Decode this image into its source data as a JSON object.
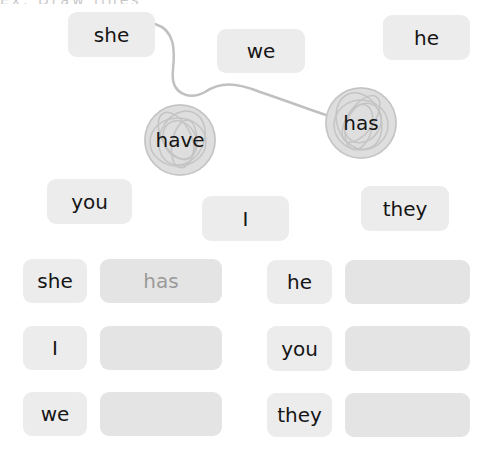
{
  "header": {
    "cutoff_text": "Ex. Draw lines"
  },
  "word_bank": {
    "tiles": [
      {
        "id": "she",
        "label": "she"
      },
      {
        "id": "we",
        "label": "we"
      },
      {
        "id": "he",
        "label": "he"
      },
      {
        "id": "you",
        "label": "you"
      },
      {
        "id": "i",
        "label": "I"
      },
      {
        "id": "they",
        "label": "they"
      }
    ],
    "circled": [
      {
        "id": "have",
        "label": "have"
      },
      {
        "id": "has",
        "label": "has"
      }
    ],
    "connection": {
      "from": "she",
      "to": "has"
    }
  },
  "answers": {
    "rows": [
      {
        "pronoun": "she",
        "answer": "has"
      },
      {
        "pronoun": "I",
        "answer": ""
      },
      {
        "pronoun": "we",
        "answer": ""
      },
      {
        "pronoun": "he",
        "answer": ""
      },
      {
        "pronoun": "you",
        "answer": ""
      },
      {
        "pronoun": "they",
        "answer": ""
      }
    ]
  },
  "colors": {
    "tile_bg": "#ececec",
    "answer_bg": "#e4e4e4",
    "scribble": "#c4c4c4",
    "line": "#c0c0c0",
    "answer_text": "#9a9a9a"
  }
}
